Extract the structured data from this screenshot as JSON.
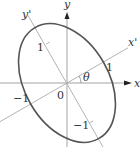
{
  "diagram": {
    "type": "rotated-ellipse-axes",
    "colors": {
      "axis": "#999999",
      "rotated_axis": "#aaaaaa",
      "ellipse": "#555555",
      "text": "#333333"
    },
    "origin": {
      "x": 67,
      "y": 83
    },
    "angle_deg": 30,
    "labels": {
      "x_axis": "x",
      "y_axis": "y",
      "x_prime": "x'",
      "y_prime": "y'",
      "theta": "θ",
      "origin": "0",
      "tick_x_prime_pos": "1",
      "tick_x_prime_neg": "−1",
      "tick_y_prime_pos": "1",
      "tick_y_prime_neg": "−1"
    },
    "ellipse": {
      "semi_axis_x_prime": 42,
      "semi_axis_y_prime": 64
    }
  }
}
